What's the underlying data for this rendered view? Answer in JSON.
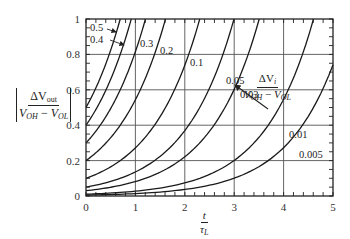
{
  "chart_data": {
    "type": "line",
    "title": "",
    "xlabel": "t / τ_L",
    "ylabel": "|ΔV_out / (V_OH − V_OL)|",
    "xlim": [
      0,
      5
    ],
    "ylim": [
      0,
      1
    ],
    "grid": true,
    "x_ticks": [
      0,
      1,
      2,
      3,
      4,
      5
    ],
    "x_tick_labels": [
      "0",
      "1",
      "2",
      "3",
      "4",
      "5"
    ],
    "y_ticks": [
      0,
      0.2,
      0.4,
      0.6,
      0.8,
      1
    ],
    "y_tick_labels": [
      "0",
      "0.2",
      "0.4",
      "0.6",
      "0.8",
      "1"
    ],
    "legend_title": "ΔV_i / (V_OH − V_OL)",
    "model": "y = a · e^(t/τ_L)",
    "series": [
      {
        "name": "0.5",
        "a": 0.5,
        "x": [
          0,
          0.2,
          0.4,
          0.6,
          0.69
        ],
        "values": [
          0.5,
          0.61,
          0.75,
          0.91,
          1.0
        ]
      },
      {
        "name": "0.4",
        "a": 0.4,
        "x": [
          0,
          0.2,
          0.4,
          0.6,
          0.8,
          0.92
        ],
        "values": [
          0.4,
          0.49,
          0.6,
          0.73,
          0.89,
          1.0
        ]
      },
      {
        "name": "0.3",
        "a": 0.3,
        "x": [
          0,
          0.4,
          0.8,
          1.0,
          1.2
        ],
        "values": [
          0.3,
          0.45,
          0.67,
          0.82,
          1.0
        ]
      },
      {
        "name": "0.2",
        "a": 0.2,
        "x": [
          0,
          0.5,
          1.0,
          1.5,
          1.61
        ],
        "values": [
          0.2,
          0.33,
          0.54,
          0.9,
          1.0
        ]
      },
      {
        "name": "0.1",
        "a": 0.1,
        "x": [
          0,
          1.0,
          1.5,
          2.0,
          2.3
        ],
        "values": [
          0.1,
          0.27,
          0.45,
          0.74,
          1.0
        ]
      },
      {
        "name": "0.05",
        "a": 0.05,
        "x": [
          0,
          1.0,
          2.0,
          2.5,
          3.0
        ],
        "values": [
          0.05,
          0.14,
          0.37,
          0.61,
          1.0
        ]
      },
      {
        "name": "0.03",
        "a": 0.03,
        "x": [
          0,
          1.0,
          2.0,
          3.0,
          3.5
        ],
        "values": [
          0.03,
          0.08,
          0.22,
          0.6,
          1.0
        ]
      },
      {
        "name": "0.01",
        "a": 0.01,
        "x": [
          0,
          2.0,
          3.0,
          4.0,
          4.6
        ],
        "values": [
          0.01,
          0.07,
          0.2,
          0.55,
          1.0
        ]
      },
      {
        "name": "0.005",
        "a": 0.005,
        "x": [
          0,
          2.0,
          3.0,
          4.0,
          5.0
        ],
        "values": [
          0.005,
          0.04,
          0.1,
          0.27,
          0.74
        ]
      }
    ],
    "annotations": [
      {
        "text": "0.5",
        "arrow": true
      },
      {
        "text": "0.4",
        "arrow": true
      },
      {
        "text": "0.3"
      },
      {
        "text": "0.2"
      },
      {
        "text": "0.1"
      },
      {
        "text": "0.05"
      },
      {
        "text": "0.03"
      },
      {
        "text": "0.01"
      },
      {
        "text": "0.005"
      }
    ]
  },
  "labels": {
    "y_axis": {
      "num_delta": "ΔV",
      "num_sub": "out",
      "den_V1": "V",
      "den_sub1": "OH",
      "den_minus": " − ",
      "den_V2": "V",
      "den_sub2": "OL"
    },
    "x_axis": {
      "num": "t",
      "den": "τ",
      "den_sub": "L"
    },
    "legend": {
      "num_delta": "ΔV",
      "num_sub": "i",
      "den_V1": "V",
      "den_sub1": "OH",
      "den_minus": " − ",
      "den_V2": "V",
      "den_sub2": "OL"
    }
  },
  "style": {
    "line_color": "#1a1a1a",
    "grid_color": "#555555",
    "frame_color": "#222222"
  }
}
